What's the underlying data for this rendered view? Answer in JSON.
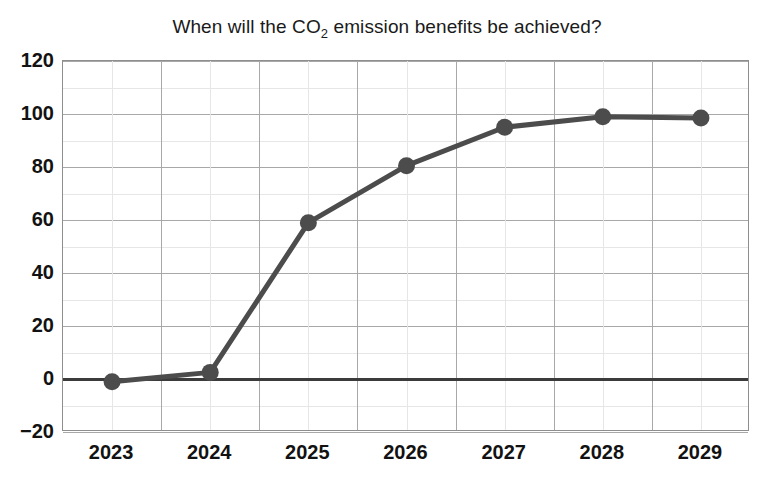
{
  "chart_data": {
    "type": "line",
    "title": "When will the CO2 emission benefits be achieved?",
    "title_parts": {
      "before": "When will the CO",
      "subscript": "2",
      "after": " emission benefits be achieved?"
    },
    "xlabel": "",
    "ylabel": "",
    "categories": [
      "2023",
      "2024",
      "2025",
      "2026",
      "2027",
      "2028",
      "2029"
    ],
    "values": [
      -1,
      2.5,
      59,
      80.5,
      95,
      99,
      98.5
    ],
    "series": [
      {
        "name": "CO2 emission benefits achieved",
        "values": [
          -1,
          2.5,
          59,
          80.5,
          95,
          99,
          98.5
        ],
        "color": "#4c4c4c",
        "marker": "circle",
        "marker_size": 17,
        "line_width": 5
      }
    ],
    "ylim": [
      -20,
      120
    ],
    "yticks": [
      120,
      100,
      80,
      60,
      40,
      20,
      0,
      -20
    ],
    "ytick_labels": [
      "120",
      "100",
      "80",
      "60",
      "40",
      "20",
      "0",
      "−20"
    ],
    "y_minor_step": 10,
    "xtick_labels": [
      "2023",
      "2024",
      "2025",
      "2026",
      "2027",
      "2028",
      "2029"
    ],
    "grid": true,
    "grid_major_color": "#a8a8a8",
    "grid_minor_color": "#e6e6e6",
    "zero_line": true,
    "zero_line_color": "#3b3b3b",
    "legend": false,
    "legend_position": "none",
    "background_color": "#ffffff",
    "axis_color": "#8e8e8e"
  }
}
